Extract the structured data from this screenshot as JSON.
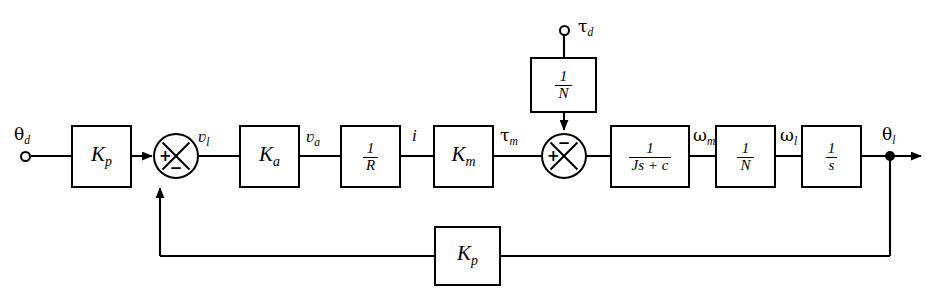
{
  "diagram": {
    "line_color": "#000000",
    "background": "#ffffff"
  },
  "terminals": [
    {
      "name": "reference-input",
      "label_base": "θ",
      "label_sub": "d",
      "label": "θd"
    },
    {
      "name": "disturbance-input",
      "label_base": "τ",
      "label_sub": "d",
      "label": "τd"
    }
  ],
  "blocks": {
    "forward_gain": {
      "label": "Kp",
      "base": "K",
      "sub": "p",
      "kind": "gain"
    },
    "amplifier_gain": {
      "label": "Ka",
      "base": "K",
      "sub": "a",
      "kind": "gain"
    },
    "resistance": {
      "label": "1/R",
      "num": "1",
      "den": "R",
      "kind": "fraction"
    },
    "motor_constant": {
      "label": "Km",
      "base": "K",
      "sub": "m",
      "kind": "gain"
    },
    "disturbance_gear": {
      "label": "1/N",
      "num": "1",
      "den": "N",
      "kind": "fraction"
    },
    "inertia_damping": {
      "label": "1/(Js + c)",
      "num": "1",
      "den": "Js + c",
      "kind": "fraction"
    },
    "gear_ratio": {
      "label": "1/N",
      "num": "1",
      "den": "N",
      "kind": "fraction"
    },
    "integrator": {
      "label": "1/s",
      "num": "1",
      "den": "s",
      "kind": "fraction"
    },
    "feedback_gain": {
      "label": "Kp",
      "base": "K",
      "sub": "p",
      "kind": "gain"
    }
  },
  "summers": {
    "error_junction": {
      "name": "error-summing-junction",
      "left": "+",
      "bottom": "−"
    },
    "disturbance_junction": {
      "name": "disturbance-summing-junction",
      "left": "+",
      "top": "−"
    }
  },
  "signals": [
    {
      "name": "theta-d",
      "base": "θ",
      "sub": "d",
      "label": "θd"
    },
    {
      "name": "v-l",
      "base": "ʋ",
      "sub": "l",
      "label": "ʋl"
    },
    {
      "name": "v-a",
      "base": "ʋ",
      "sub": "a",
      "label": "ʋa"
    },
    {
      "name": "current-i",
      "base": "i",
      "sub": "",
      "label": "i"
    },
    {
      "name": "tau-m",
      "base": "τ",
      "sub": "m",
      "label": "τm"
    },
    {
      "name": "tau-d",
      "base": "τ",
      "sub": "d",
      "label": "τd"
    },
    {
      "name": "omega-m",
      "base": "ω",
      "sub": "m",
      "label": "ωm"
    },
    {
      "name": "omega-l",
      "base": "ω",
      "sub": "l",
      "label": "ωl"
    },
    {
      "name": "theta-l",
      "base": "θ",
      "sub": "l",
      "label": "θl"
    }
  ]
}
